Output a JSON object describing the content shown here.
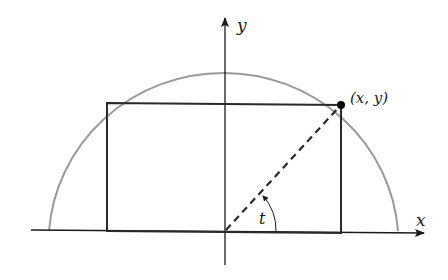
{
  "diagram": {
    "labels": {
      "y_axis": "y",
      "x_axis": "x",
      "point": "(x, y)",
      "angle": "t"
    },
    "colors": {
      "semicircle": "#9a9a9a",
      "rectangle": "#2a2a2a",
      "axes": "#1a1a1a",
      "dashed_radius": "#2a2a2a",
      "point": "#000000"
    }
  }
}
